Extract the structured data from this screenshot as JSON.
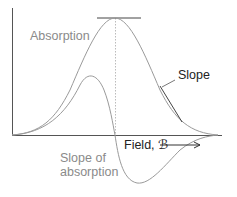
{
  "diagram": {
    "labels": {
      "absorption": "Absorption",
      "slope": "Slope",
      "slope_of_absorption_line1": "Slope of",
      "slope_of_absorption_line2": "absorption",
      "field": "Field, ℬ"
    },
    "colors": {
      "curve": "#9a9a9a",
      "axis": "#555555",
      "tangent": "#444444",
      "gray_text": "#8a8a8a",
      "dark_text": "#222222"
    }
  }
}
